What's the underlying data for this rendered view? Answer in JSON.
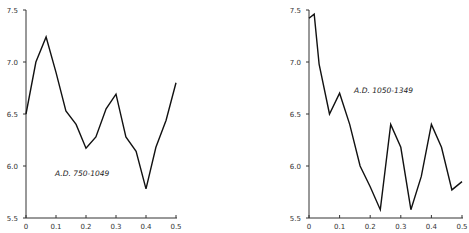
{
  "chart_data": [
    {
      "type": "line",
      "title": "",
      "annotation": "A.D. 750-1049",
      "xlabel": "",
      "ylabel": "",
      "xlim": [
        0,
        0.5
      ],
      "ylim": [
        5.5,
        7.5
      ],
      "xticks": [
        "0",
        "0.1",
        "0.2",
        "0.3",
        "0.4",
        "0.5"
      ],
      "xtick_values": [
        0,
        0.1,
        0.2,
        0.3,
        0.4,
        0.5
      ],
      "yticks": [
        "5.5",
        "6.0",
        "6.5",
        "7.0",
        "7.5"
      ],
      "ytick_values": [
        5.5,
        6.0,
        6.5,
        7.0,
        7.5
      ],
      "grid": false,
      "series": [
        {
          "name": "A.D. 750-1049",
          "x": [
            0,
            0.033,
            0.067,
            0.1,
            0.133,
            0.167,
            0.2,
            0.233,
            0.267,
            0.3,
            0.333,
            0.367,
            0.4,
            0.433,
            0.467,
            0.5
          ],
          "values": [
            6.5,
            7.0,
            7.24,
            6.9,
            6.53,
            6.4,
            6.17,
            6.28,
            6.55,
            6.69,
            6.28,
            6.14,
            5.78,
            6.18,
            6.44,
            6.8
          ]
        }
      ]
    },
    {
      "type": "line",
      "title": "",
      "annotation": "A.D. 1050-1349",
      "xlabel": "",
      "ylabel": "",
      "xlim": [
        0,
        0.5
      ],
      "ylim": [
        5.5,
        7.5
      ],
      "xticks": [
        "0",
        "0.1",
        "0.2",
        "0.3",
        "0.4",
        "0.5"
      ],
      "xtick_values": [
        0,
        0.1,
        0.2,
        0.3,
        0.4,
        0.5
      ],
      "yticks": [
        "5.5",
        "6.0",
        "6.5",
        "7.0",
        "7.5"
      ],
      "ytick_values": [
        5.5,
        6.0,
        6.5,
        7.0,
        7.5
      ],
      "grid": false,
      "series": [
        {
          "name": "A.D. 1050-1349",
          "x": [
            0,
            0.017,
            0.033,
            0.067,
            0.1,
            0.133,
            0.167,
            0.2,
            0.233,
            0.267,
            0.3,
            0.333,
            0.367,
            0.4,
            0.433,
            0.467,
            0.5
          ],
          "values": [
            7.42,
            7.46,
            6.98,
            6.5,
            6.7,
            6.4,
            6.0,
            5.8,
            5.58,
            6.4,
            6.18,
            5.58,
            5.9,
            6.4,
            6.18,
            5.77,
            5.85
          ]
        }
      ]
    }
  ]
}
